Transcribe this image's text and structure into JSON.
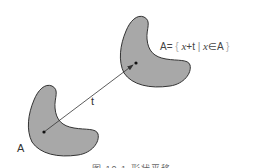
{
  "figure": {
    "shape_original_label": "A",
    "translation_label": "t",
    "formula": {
      "lhs": "A=",
      "open": "{",
      "var1": "x",
      "plus_t": "+t",
      "bar": "|",
      "var2": "x",
      "in": "∈A",
      "close": "}"
    },
    "caption": "图 10.1   形状平移",
    "colors": {
      "shape_fill": "#a8a8a8",
      "shape_stroke": "#333333",
      "arrow": "#333333"
    }
  }
}
